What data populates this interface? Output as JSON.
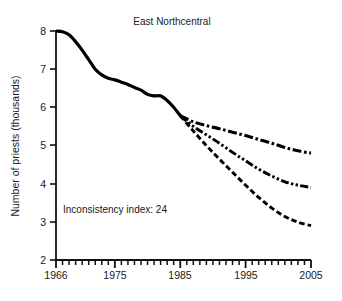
{
  "chart_data": {
    "type": "line",
    "title": "East Northcentral",
    "xlabel": "",
    "ylabel": "Number of priests (thousands)",
    "xlim": [
      1966,
      2005
    ],
    "ylim": [
      2,
      8
    ],
    "grid": false,
    "legend": "none",
    "xticks": [
      1966,
      1975,
      1985,
      1995,
      2005
    ],
    "xtick_labels": [
      "1966",
      "1975",
      "1985",
      "1995",
      "2005"
    ],
    "minor_xtick_interval": 1,
    "yticks": [
      2,
      3,
      4,
      5,
      6,
      7,
      8
    ],
    "ytick_labels": [
      "2",
      "3",
      "4",
      "5",
      "6",
      "7",
      "8"
    ],
    "annotations": [
      {
        "text": "Inconsistency index: 24",
        "x": 1972,
        "y": 3.3
      }
    ],
    "series": [
      {
        "name": "historical",
        "style": "solid",
        "x": [
          1966,
          1967,
          1968,
          1969,
          1970,
          1971,
          1972,
          1973,
          1974,
          1975,
          1976,
          1977,
          1978,
          1979,
          1980,
          1981,
          1982,
          1983,
          1984,
          1985
        ],
        "values": [
          8.0,
          7.98,
          7.9,
          7.72,
          7.5,
          7.25,
          7.0,
          6.85,
          6.76,
          6.72,
          6.66,
          6.6,
          6.52,
          6.45,
          6.34,
          6.3,
          6.3,
          6.18,
          6.0,
          5.78
        ]
      },
      {
        "name": "projection-high",
        "style": "dash-dot",
        "x": [
          1985,
          1987,
          1989,
          1991,
          1993,
          1995,
          1997,
          1999,
          2001,
          2003,
          2005
        ],
        "values": [
          5.78,
          5.62,
          5.52,
          5.44,
          5.35,
          5.26,
          5.16,
          5.06,
          4.95,
          4.86,
          4.8
        ]
      },
      {
        "name": "projection-mid",
        "style": "dash-dot-dot",
        "x": [
          1985,
          1987,
          1989,
          1991,
          1993,
          1995,
          1997,
          1999,
          2001,
          2003,
          2005
        ],
        "values": [
          5.78,
          5.5,
          5.28,
          5.06,
          4.82,
          4.6,
          4.38,
          4.2,
          4.05,
          3.96,
          3.9
        ]
      },
      {
        "name": "projection-low",
        "style": "dashed",
        "x": [
          1985,
          1987,
          1989,
          1991,
          1993,
          1995,
          1997,
          1999,
          2001,
          2003,
          2005
        ],
        "values": [
          5.78,
          5.38,
          5.0,
          4.64,
          4.3,
          3.96,
          3.64,
          3.36,
          3.14,
          2.99,
          2.9
        ]
      }
    ]
  },
  "axes": {
    "title": "East Northcentral",
    "y_axis_title": "Number of priests (thousands)",
    "annotation": "Inconsistency index: 24",
    "x_labels": [
      "1966",
      "1975",
      "1985",
      "1995",
      "2005"
    ],
    "y_labels": [
      "8",
      "7",
      "6",
      "5",
      "4",
      "3",
      "2"
    ]
  },
  "colors": {
    "line": "#000000",
    "axis": "#1a1a1a",
    "background": "#ffffff"
  }
}
